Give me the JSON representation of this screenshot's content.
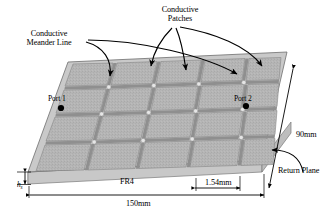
{
  "figure": {
    "type": "engineering-diagram",
    "callouts": [
      {
        "id": "meander",
        "label": "Conductive\nMeander Line",
        "line1": "Conductive",
        "line2": "Meander Line",
        "arrow_count": 2
      },
      {
        "id": "patches",
        "label": "Conductive\nPatches",
        "line1": "Conductive",
        "line2": "Patches",
        "arrow_count": 3
      }
    ],
    "ports": [
      {
        "id": "port1",
        "label": "Port 1",
        "marker": "filled-dot"
      },
      {
        "id": "port2",
        "label": "Port 2",
        "marker": "filled-dot"
      }
    ],
    "dimensions": [
      {
        "id": "length",
        "value": "150mm",
        "orientation": "horizontal",
        "position": "bottom"
      },
      {
        "id": "width",
        "value": "90mm",
        "orientation": "diagonal",
        "position": "right"
      },
      {
        "id": "gap",
        "value": "1.54mm",
        "orientation": "horizontal",
        "position": "bottom-right"
      },
      {
        "id": "thickness",
        "value": "h",
        "subscript": "s",
        "orientation": "vertical",
        "position": "left"
      }
    ],
    "material_labels": [
      {
        "id": "substrate",
        "label": "FR4"
      },
      {
        "id": "ground",
        "label": "Return Plane"
      }
    ],
    "grid": {
      "columns": 5,
      "rows": 4
    },
    "colors": {
      "patch_top": "#b5b5b5",
      "patch_shade": "#a8a8a8",
      "meander_line": "#8e8e8e",
      "substrate_side": "#cfcfcf",
      "substrate_front": "#c4c4c4",
      "outline": "#6a6a6a",
      "text": "#000000",
      "arrow": "#000000",
      "background": "#ffffff"
    }
  }
}
